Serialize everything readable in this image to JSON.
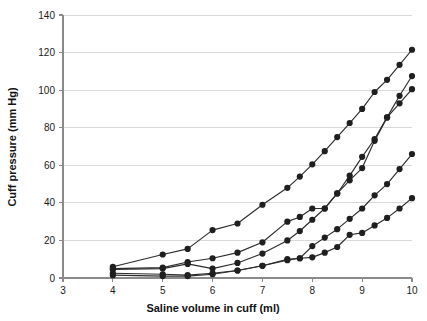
{
  "chart_data": {
    "type": "line",
    "title": "",
    "subtitle": "",
    "xlabel": "Saline volume in cuff (ml)",
    "ylabel": "Cuff pressure (mm Hg)",
    "xlim": [
      3,
      10
    ],
    "ylim": [
      0,
      140
    ],
    "xticks": [
      3,
      4,
      5,
      6,
      7,
      8,
      9,
      10
    ],
    "yticks": [
      0,
      20,
      40,
      60,
      80,
      100,
      120,
      140
    ],
    "xtick_labels": [
      "3",
      "4",
      "5",
      "6",
      "7",
      "8",
      "9",
      "10"
    ],
    "ytick_labels": [
      "0",
      "20",
      "40",
      "60",
      "80",
      "100",
      "120",
      "140"
    ],
    "grid": "horizontal",
    "legend": "none",
    "legend_position": "none",
    "marker": "filled-circle",
    "line_color": "#2b2b2b",
    "marker_color": "#1f1f1f",
    "grid_color": "#d9d9d9",
    "axis_color": "#8a8a8a",
    "annotations": [],
    "series": [
      {
        "name": "cuff-1",
        "x": [
          4,
          5,
          5.5,
          6,
          6.5,
          7,
          7.5,
          7.75,
          8,
          8.25,
          8.5,
          8.75,
          9,
          9.25,
          9.5,
          9.75,
          10
        ],
        "values": [
          6,
          12.5,
          15.5,
          25.5,
          29,
          39,
          48,
          54,
          60.5,
          67.5,
          75,
          82.5,
          90,
          99,
          105.5,
          113.5,
          121.5
        ]
      },
      {
        "name": "cuff-2",
        "x": [
          4,
          5,
          5.5,
          6,
          6.5,
          7,
          7.5,
          7.75,
          8,
          8.25,
          8.5,
          8.75,
          9,
          9.25,
          9.5,
          9.75,
          10
        ],
        "values": [
          5,
          5.5,
          8.5,
          10.5,
          13.5,
          19,
          30,
          32.5,
          37,
          37,
          45,
          52,
          58.5,
          73,
          85.5,
          93,
          100.5
        ]
      },
      {
        "name": "cuff-3",
        "x": [
          4,
          5,
          5.5,
          6,
          6.5,
          7,
          7.5,
          7.75,
          8,
          8.25,
          8.5,
          8.75,
          9,
          9.25,
          9.5,
          9.75,
          10
        ],
        "values": [
          4.5,
          5,
          7.5,
          5,
          8,
          13,
          20,
          25,
          31,
          37,
          45,
          54.5,
          64.5,
          74,
          85.5,
          97,
          107.5
        ]
      },
      {
        "name": "cuff-4",
        "x": [
          4,
          5,
          5.5,
          6,
          6.5,
          7,
          7.5,
          7.75,
          8,
          8.25,
          8.5,
          8.75,
          9,
          9.25,
          9.5,
          9.75,
          10
        ],
        "values": [
          2.5,
          2,
          1.5,
          2.5,
          4,
          6.5,
          9.5,
          10.5,
          17,
          21.5,
          26,
          31.5,
          37,
          44,
          50,
          58,
          66
        ]
      },
      {
        "name": "cuff-5",
        "x": [
          4,
          5,
          5.5,
          6,
          6.5,
          7,
          7.5,
          7.75,
          8,
          8.25,
          8.5,
          8.75,
          9,
          9.25,
          9.5,
          9.75,
          10
        ],
        "values": [
          1.5,
          1,
          1,
          2,
          4,
          6.5,
          10,
          10.5,
          11,
          13.5,
          16.5,
          23,
          24,
          28,
          32,
          37,
          42.5
        ]
      }
    ]
  }
}
